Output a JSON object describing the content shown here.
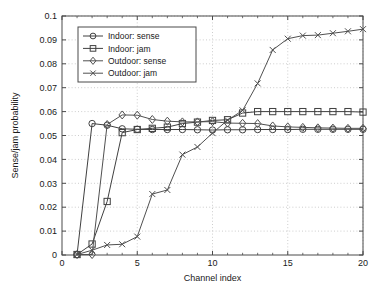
{
  "chart_data": {
    "type": "line",
    "title": "",
    "subtitle": "",
    "xlabel": "Channel index",
    "ylabel": "Sense/jam probability",
    "xlim": [
      0,
      20
    ],
    "ylim": [
      0,
      0.1
    ],
    "xticks": [
      "0",
      "5",
      "10",
      "15",
      "20"
    ],
    "xtick_values": [
      0,
      5,
      10,
      15,
      20
    ],
    "yticks": [
      "0",
      "0.01",
      "0.02",
      "0.03",
      "0.04",
      "0.05",
      "0.06",
      "0.07",
      "0.08",
      "0.09",
      "0.1"
    ],
    "ytick_values": [
      0,
      0.01,
      0.02,
      0.03,
      0.04,
      0.05,
      0.06,
      0.07,
      0.08,
      0.09,
      0.1
    ],
    "grid": true,
    "grid_style": "dotted",
    "legend_position": "upper left",
    "x": [
      1,
      2,
      3,
      4,
      5,
      6,
      7,
      8,
      9,
      10,
      11,
      12,
      13,
      14,
      15,
      16,
      17,
      18,
      19,
      20
    ],
    "series": [
      {
        "name": "Indoor: sense",
        "marker": "circle",
        "color": "#404040",
        "values": [
          0.0002,
          0.055,
          0.0543,
          0.0528,
          0.0526,
          0.0525,
          0.0525,
          0.0525,
          0.0524,
          0.0523,
          0.0524,
          0.0524,
          0.0525,
          0.0525,
          0.0525,
          0.0526,
          0.0526,
          0.0526,
          0.0526,
          0.0526
        ]
      },
      {
        "name": "Indoor: jam",
        "marker": "square",
        "color": "#404040",
        "values": [
          0.0002,
          0.0046,
          0.0224,
          0.0512,
          0.0525,
          0.053,
          0.0535,
          0.055,
          0.0556,
          0.0563,
          0.0566,
          0.0594,
          0.06,
          0.06,
          0.06,
          0.06,
          0.06,
          0.06,
          0.06,
          0.0598
        ]
      },
      {
        "name": "Outdoor: sense",
        "marker": "diamond",
        "color": "#505050",
        "values": [
          0.0002,
          0.0002,
          0.0546,
          0.0586,
          0.0585,
          0.0567,
          0.056,
          0.0557,
          0.0557,
          0.0558,
          0.0552,
          0.0551,
          0.055,
          0.054,
          0.0536,
          0.0534,
          0.0532,
          0.0531,
          0.053,
          0.053
        ]
      },
      {
        "name": "Outdoor: jam",
        "marker": "cross",
        "color": "#505050",
        "values": [
          0.0002,
          0.002,
          0.0042,
          0.0045,
          0.0077,
          0.0255,
          0.0272,
          0.042,
          0.0452,
          0.051,
          0.0564,
          0.0605,
          0.0718,
          0.0858,
          0.0905,
          0.0918,
          0.092,
          0.0928,
          0.0936,
          0.0945
        ]
      }
    ]
  },
  "legend": {
    "items": [
      {
        "label": "Indoor: sense"
      },
      {
        "label": "Indoor: jam"
      },
      {
        "label": "Outdoor: sense"
      },
      {
        "label": "Outdoor: jam"
      }
    ]
  },
  "colors": {
    "axis": "#4a4a4a",
    "grid": "#b8b8b8",
    "background": "#ffffff",
    "text": "#1a1a1a"
  }
}
